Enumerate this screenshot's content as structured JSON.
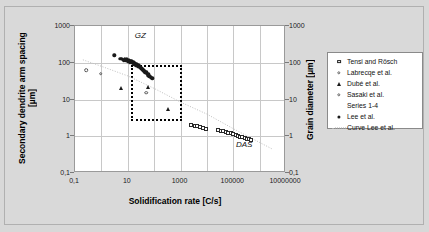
{
  "chart_data": {
    "type": "scatter",
    "title": "",
    "xlabel": "Solidification rate [C/s]",
    "ylabel": "Secondary dendrite arm spacing [µm]",
    "y2label": "Grain diameter [µm]",
    "xscale": "log",
    "yscale": "log",
    "xlim": [
      0.1,
      10000000
    ],
    "ylim": [
      0.1,
      1000
    ],
    "grid": true,
    "legend_position": "right-outside",
    "xticklabels": [
      "0,1",
      "10",
      "1000",
      "100000",
      "10000000"
    ],
    "xtickvalues": [
      0.1,
      10,
      1000,
      100000,
      10000000
    ],
    "yticklabels": [
      "1000",
      "100",
      "10",
      "1",
      "0,1"
    ],
    "ytickvalues": [
      1000,
      100,
      10,
      1,
      0.1
    ],
    "y2ticklabels": [
      "1000",
      "100",
      "10",
      "1",
      "0,1"
    ],
    "y2tickvalues": [
      1000,
      100,
      10,
      1,
      0.1
    ],
    "annotations": [
      {
        "text": "GZ",
        "x": 30,
        "y": 560
      },
      {
        "text": "DAS",
        "x": 260000,
        "y": 0.62
      }
    ],
    "highlight_box": {
      "label": "dotted-region",
      "x_range": [
        13,
        1100
      ],
      "y_range": [
        2.6,
        88
      ]
    },
    "series": [
      {
        "name": "Tensi and Rösch",
        "marker": "open-square",
        "points": [
          {
            "x": 2600,
            "y": 2.05
          },
          {
            "x": 3400,
            "y": 1.95
          },
          {
            "x": 4200,
            "y": 1.85
          },
          {
            "x": 5400,
            "y": 1.8
          },
          {
            "x": 7000,
            "y": 1.7
          },
          {
            "x": 9000,
            "y": 1.6
          },
          {
            "x": 26000,
            "y": 1.45
          },
          {
            "x": 33000,
            "y": 1.4
          },
          {
            "x": 42000,
            "y": 1.35
          },
          {
            "x": 52000,
            "y": 1.3
          },
          {
            "x": 64000,
            "y": 1.25
          },
          {
            "x": 80000,
            "y": 1.2
          },
          {
            "x": 100000,
            "y": 1.12
          },
          {
            "x": 125000,
            "y": 1.08
          },
          {
            "x": 150000,
            "y": 1.02
          },
          {
            "x": 180000,
            "y": 0.97
          },
          {
            "x": 220000,
            "y": 0.93
          },
          {
            "x": 270000,
            "y": 0.9
          },
          {
            "x": 330000,
            "y": 0.86
          },
          {
            "x": 400000,
            "y": 0.83
          },
          {
            "x": 480000,
            "y": 0.8
          }
        ]
      },
      {
        "name": "Labrecqe et al.",
        "marker": "open-circle",
        "points": [
          {
            "x": 0.26,
            "y": 62
          },
          {
            "x": 0.95,
            "y": 50
          }
        ]
      },
      {
        "name": "Dubé et al.",
        "marker": "filled-triangle",
        "points": [
          {
            "x": 5.5,
            "y": 20
          },
          {
            "x": 60,
            "y": 22
          },
          {
            "x": 330,
            "y": 5.6
          }
        ]
      },
      {
        "name": "Sasaki et al.",
        "marker": "open-circle",
        "points": [
          {
            "x": 50,
            "y": 15.5
          }
        ]
      },
      {
        "name": "Series 1-4",
        "marker": "none",
        "points": []
      },
      {
        "name": "Lee et al.",
        "marker": "filled-circle",
        "points": [
          {
            "x": 3.1,
            "y": 160
          },
          {
            "x": 5.2,
            "y": 126
          },
          {
            "x": 6.0,
            "y": 130
          },
          {
            "x": 6.8,
            "y": 120
          },
          {
            "x": 7.6,
            "y": 128
          },
          {
            "x": 8.4,
            "y": 118
          },
          {
            "x": 9.2,
            "y": 124
          },
          {
            "x": 10.0,
            "y": 115
          },
          {
            "x": 10.8,
            "y": 120
          },
          {
            "x": 11.6,
            "y": 110
          },
          {
            "x": 12.4,
            "y": 114
          },
          {
            "x": 13.2,
            "y": 106
          },
          {
            "x": 14.0,
            "y": 110
          },
          {
            "x": 15.0,
            "y": 100
          },
          {
            "x": 16.0,
            "y": 104
          },
          {
            "x": 17.0,
            "y": 96
          },
          {
            "x": 18.0,
            "y": 100
          },
          {
            "x": 19.0,
            "y": 92
          },
          {
            "x": 20.0,
            "y": 95
          },
          {
            "x": 21.0,
            "y": 88
          },
          {
            "x": 22.0,
            "y": 90
          },
          {
            "x": 23.5,
            "y": 84
          },
          {
            "x": 25.0,
            "y": 86
          },
          {
            "x": 27.0,
            "y": 80
          },
          {
            "x": 29.0,
            "y": 78
          },
          {
            "x": 31.0,
            "y": 74
          },
          {
            "x": 33.0,
            "y": 70
          },
          {
            "x": 36.0,
            "y": 66
          },
          {
            "x": 39.0,
            "y": 62
          },
          {
            "x": 43.0,
            "y": 58
          },
          {
            "x": 47.0,
            "y": 54
          },
          {
            "x": 52.0,
            "y": 50
          },
          {
            "x": 58.0,
            "y": 46
          },
          {
            "x": 65.0,
            "y": 43
          },
          {
            "x": 74.0,
            "y": 40
          },
          {
            "x": 85.0,
            "y": 38
          },
          {
            "x": 7.2,
            "y": 112
          },
          {
            "x": 9.8,
            "y": 108
          },
          {
            "x": 12.0,
            "y": 102
          },
          {
            "x": 14.5,
            "y": 98
          },
          {
            "x": 17.5,
            "y": 91
          },
          {
            "x": 20.5,
            "y": 85
          },
          {
            "x": 24.0,
            "y": 79
          },
          {
            "x": 28.0,
            "y": 73
          },
          {
            "x": 34.0,
            "y": 68
          },
          {
            "x": 41.0,
            "y": 61
          },
          {
            "x": 50.0,
            "y": 55
          },
          {
            "x": 60.0,
            "y": 48
          }
        ]
      },
      {
        "name": "Curve Lee et al.",
        "marker": "dotted-line",
        "points": []
      }
    ]
  },
  "legend": {
    "items": [
      {
        "label": "Tensi and Rösch",
        "marker": "open-square"
      },
      {
        "label": "Labrecqe et al.",
        "marker": "open-circle"
      },
      {
        "label": "Dubé et al.",
        "marker": "filled-triangle"
      },
      {
        "label": "Sasaki et al.",
        "marker": "open-circle"
      },
      {
        "label": "Series 1-4",
        "marker": "none"
      },
      {
        "label": "Lee et al.",
        "marker": "filled-circle"
      },
      {
        "label": "Curve Lee et al.",
        "marker": "dotted-line"
      }
    ]
  },
  "colors": {
    "background": "#d9d9d9",
    "plot_background": "#ffffff",
    "gridline": "#c8c8c8",
    "marker": "#1a1a1a",
    "box": "#000000"
  }
}
